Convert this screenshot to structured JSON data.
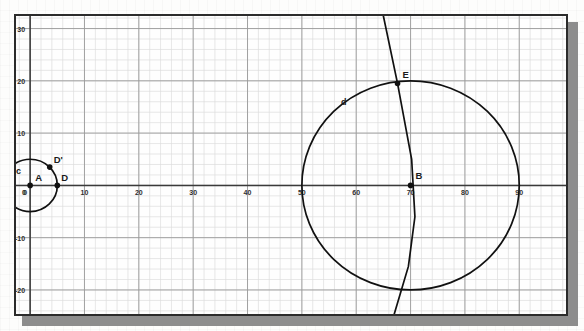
{
  "app": {
    "view_name": "Graphics View",
    "background_color": "#fefefe",
    "frame_color": "#2b2b2b",
    "shadow_color": "#8d8d8d"
  },
  "axes": {
    "x_label": "",
    "y_label": "",
    "x_ticks": [
      "0",
      "10",
      "20",
      "30",
      "40",
      "50",
      "60",
      "70",
      "80",
      "90"
    ],
    "x_tick_values": [
      0,
      10,
      20,
      30,
      40,
      50,
      60,
      70,
      80,
      90
    ],
    "y_ticks": [
      "30",
      "20",
      "10",
      "0",
      "-10",
      "-20"
    ],
    "y_tick_values": [
      30,
      20,
      10,
      0,
      -10,
      -20
    ],
    "origin_label": "0",
    "left_edge_label": "0",
    "axis_color": "#3a3a3a",
    "major_grid_color": "#9a9a9a",
    "minor_grid_color": "#dcdcdc",
    "major_grid_step": 10,
    "minor_grid_step": 2,
    "x_range": [
      -2.6,
      98.6
    ],
    "y_range": [
      -24.6,
      32.4
    ]
  },
  "chart_data": {
    "type": "scatter",
    "title": "",
    "xlabel": "",
    "ylabel": "",
    "xlim": [
      -2.6,
      98.6
    ],
    "ylim": [
      -24.6,
      32.4
    ],
    "grid": true,
    "legend": "none",
    "points": [
      {
        "name": "A",
        "x": 0,
        "y": 0,
        "label": "A",
        "label_dx": 5,
        "label_dy": -4,
        "style": "filled-dot"
      },
      {
        "name": "B",
        "x": 70,
        "y": 0,
        "label": "B",
        "label_dx": 5,
        "label_dy": -6,
        "style": "filled-dot"
      },
      {
        "name": "C",
        "x": -5,
        "y": 0,
        "label": "C",
        "label_dx": -14,
        "label_dy": -3,
        "style": "filled-dot"
      },
      {
        "name": "D",
        "x": 5,
        "y": 0,
        "label": "D",
        "label_dx": 4,
        "label_dy": -4,
        "style": "filled-dot"
      },
      {
        "name": "Dprime",
        "x": 3.6,
        "y": 3.5,
        "label": "D'",
        "label_dx": 4,
        "label_dy": -4,
        "style": "filled-dot"
      },
      {
        "name": "E",
        "x": 67.6,
        "y": 19.5,
        "label": "E",
        "label_dx": 5,
        "label_dy": -5,
        "style": "filled-dot"
      }
    ],
    "circles": [
      {
        "name": "c",
        "label": "c",
        "center_x": 0,
        "center_y": 0,
        "radius": 5,
        "label_x": -2.6,
        "label_y": 2.2
      },
      {
        "name": "d",
        "label": "d",
        "center_x": 70,
        "center_y": 0,
        "radius": 20,
        "label_x": 57.2,
        "label_y": 15.4
      }
    ],
    "arcs": [
      {
        "name": "vertical-arc",
        "description": "large-radius arc crossing circle d through point E",
        "points": [
          {
            "x": 65.0,
            "y": 32.4
          },
          {
            "x": 67.6,
            "y": 19.5
          },
          {
            "x": 70.2,
            "y": 5.0
          },
          {
            "x": 70.8,
            "y": -6.0
          },
          {
            "x": 69.6,
            "y": -15.5
          },
          {
            "x": 67.0,
            "y": -24.6
          }
        ]
      }
    ]
  },
  "labels": {
    "point_A": "A",
    "point_B": "B",
    "point_C": "C",
    "point_D": "D",
    "point_D_prime": "D'",
    "point_E": "E",
    "circle_c": "c",
    "circle_d": "d"
  }
}
